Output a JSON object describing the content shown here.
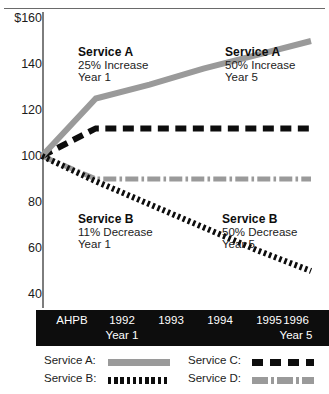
{
  "chart_data": {
    "type": "line",
    "title": "",
    "xlabel": "",
    "ylabel": "",
    "ylim": [
      40,
      160
    ],
    "yticks": [
      "$160",
      "140",
      "120",
      "100",
      "80",
      "60",
      "40"
    ],
    "ytick_values": [
      160,
      140,
      120,
      100,
      80,
      60,
      40
    ],
    "grid": false,
    "legend_position": "bottom",
    "categories": [
      "AHPB",
      "1992",
      "1993",
      "1994",
      "1995",
      "1996"
    ],
    "category_sublabels": [
      "",
      "Year 1",
      "",
      "",
      "",
      "Year 5"
    ],
    "series": [
      {
        "name": "Service A",
        "style": "solid",
        "color": "#9a9a9a",
        "values": [
          100,
          125,
          131,
          138,
          144,
          150
        ]
      },
      {
        "name": "Service B",
        "style": "dotted",
        "color": "#0d0d0d",
        "values": [
          100,
          89,
          79,
          69,
          59,
          50
        ]
      },
      {
        "name": "Service C",
        "style": "dashed",
        "color": "#0d0d0d",
        "values": [
          100,
          112,
          112,
          112,
          112,
          112
        ]
      },
      {
        "name": "Service D",
        "style": "dash-dot",
        "color": "#9a9a9a",
        "values": [
          100,
          90,
          90,
          90,
          90,
          90
        ]
      }
    ],
    "annotations": [
      {
        "id": "a-year1",
        "title": "Service A",
        "line1": "25% Increase",
        "line2": "Year 1"
      },
      {
        "id": "a-year5",
        "title": "Service A",
        "line1": "50% Increase",
        "line2": "Year 5"
      },
      {
        "id": "b-year1",
        "title": "Service B",
        "line1": "11% Decrease",
        "line2": "Year 1"
      },
      {
        "id": "b-year5",
        "title": "Service B",
        "line1": "50% Decrease",
        "line2": "Year 5"
      }
    ]
  },
  "yaxis": {
    "t160": "$160",
    "t140": "140",
    "t120": "120",
    "t100": "100",
    "t80": "80",
    "t60": "60",
    "t40": "40"
  },
  "xaxis": {
    "c0": "AHPB",
    "c1": "1992",
    "c2": "1993",
    "c3": "1994",
    "c4": "1995",
    "c5": "1996",
    "s1": "Year 1",
    "s5": "Year 5"
  },
  "annotations": {
    "a1": {
      "title": "Service A",
      "line1": "25% Increase",
      "line2": "Year 1"
    },
    "a5": {
      "title": "Service A",
      "line1": "50% Increase",
      "line2": "Year 5"
    },
    "b1": {
      "title": "Service B",
      "line1": "11% Decrease",
      "line2": "Year 1"
    },
    "b5": {
      "title": "Service B",
      "line1": "50% Decrease",
      "line2": "Year 5"
    }
  },
  "legend": {
    "a": "Service A:",
    "b": "Service B:",
    "c": "Service C:",
    "d": "Service D:"
  },
  "colors": {
    "gray_series": "#9a9a9a",
    "black_series": "#0d0d0d",
    "axis": "#7d7d7d",
    "xbar_bg": "#0d0d0d"
  }
}
